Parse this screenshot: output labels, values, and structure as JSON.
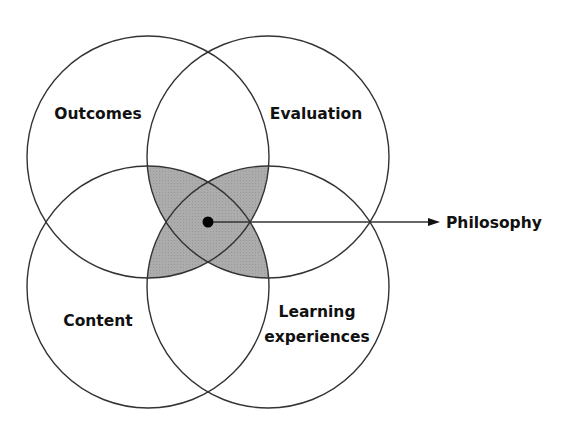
{
  "diagram": {
    "type": "venn-four-circle",
    "circles": [
      {
        "id": "outcomes",
        "label": "Outcomes",
        "cx": 148,
        "cy": 157,
        "r": 121
      },
      {
        "id": "evaluation",
        "label": "Evaluation",
        "cx": 268,
        "cy": 157,
        "r": 121
      },
      {
        "id": "content",
        "label": "Content",
        "cx": 148,
        "cy": 287,
        "r": 121
      },
      {
        "id": "learning",
        "label_line1": "Learning",
        "label_line2": "experiences",
        "cx": 268,
        "cy": 287,
        "r": 121
      }
    ],
    "center": {
      "label": "Philosophy",
      "dot": {
        "x": 208,
        "y": 222
      }
    },
    "colors": {
      "stroke": "#333333",
      "shaded_region": "#a9a9a9",
      "text": "#111111",
      "background": "#ffffff"
    }
  }
}
